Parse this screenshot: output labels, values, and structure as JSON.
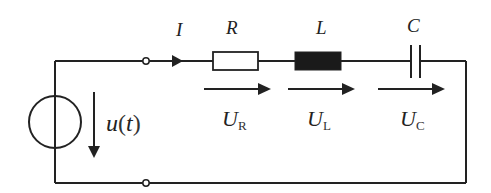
{
  "diagram": {
    "type": "series RLC circuit",
    "colors": {
      "line": "#222222",
      "background": "#ffffff",
      "inductor_fill": "#1a1a1a"
    },
    "current": {
      "symbol": "I"
    },
    "source": {
      "label": "u(t)",
      "label_main": "u",
      "label_paren_open": "(",
      "label_var": "t",
      "label_paren_close": ")"
    },
    "components": [
      {
        "id": "resistor",
        "symbol": "R",
        "voltage_main": "U",
        "voltage_sub": "R"
      },
      {
        "id": "inductor",
        "symbol": "L",
        "voltage_main": "U",
        "voltage_sub": "L"
      },
      {
        "id": "capacitor",
        "symbol": "C",
        "voltage_main": "U",
        "voltage_sub": "C"
      }
    ]
  }
}
